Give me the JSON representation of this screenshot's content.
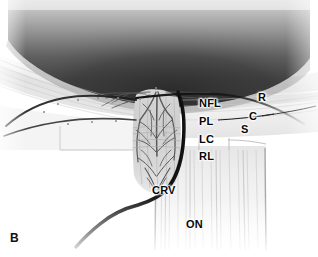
{
  "figure": {
    "panel_letter": "B"
  },
  "labels": [
    {
      "id": "nfl",
      "text": "NFL",
      "meaning": "nerve fiber layer",
      "class": "lbl-nfl"
    },
    {
      "id": "pl",
      "text": "PL",
      "meaning": "prelaminar region",
      "class": "lbl-pl"
    },
    {
      "id": "lc",
      "text": "LC",
      "meaning": "lamina cribrosa",
      "class": "lbl-lc"
    },
    {
      "id": "rl",
      "text": "RL",
      "meaning": "retrolaminar region",
      "class": "lbl-rl"
    },
    {
      "id": "r",
      "text": "R",
      "meaning": "retina",
      "class": "lbl-r"
    },
    {
      "id": "c",
      "text": "C",
      "meaning": "choroid",
      "class": "lbl-c"
    },
    {
      "id": "s",
      "text": "S",
      "meaning": "sclera",
      "class": "lbl-s"
    },
    {
      "id": "crv",
      "text": "CRV",
      "meaning": "central retinal vessel",
      "class": "lbl-crv"
    },
    {
      "id": "on",
      "text": "ON",
      "meaning": "optic nerve",
      "class": "lbl-on"
    }
  ],
  "colors": {
    "background": "#ffffff",
    "vitreous_dark": "#2e2e2e",
    "vitreous_light": "#e9e9e9",
    "tissue_light": "#f2f2f2",
    "tissue_mid": "#d8d8d8",
    "vessel_dark": "#1a1a1a",
    "capillary": "#6a6a6a",
    "label_text": "#080808"
  },
  "leader_lines": [
    {
      "id": "pl-leader",
      "from": "PL",
      "to": "choroid boundary"
    },
    {
      "id": "c-leader",
      "from": "C",
      "to": "choroid layer"
    }
  ]
}
